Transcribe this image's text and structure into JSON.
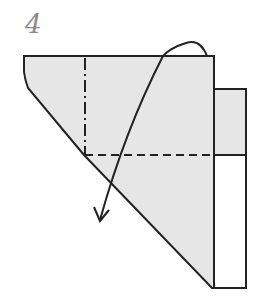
{
  "diagram": {
    "step_number": "4",
    "colors": {
      "paper_fill": "#e6e6e6",
      "outline": "#222222",
      "back_strip_fill": "#ffffff",
      "step_number": "#8a8a8a"
    },
    "elements": [
      {
        "type": "folded-paper-shape",
        "description": "grey shaded trapezoid/triangle paper"
      },
      {
        "type": "right-strip-upper",
        "description": "shaded strip right of main shape above dashed line"
      },
      {
        "type": "right-strip-lower",
        "description": "white strip below dashed line"
      },
      {
        "type": "valley-fold-line",
        "style": "dashed",
        "orientation": "horizontal"
      },
      {
        "type": "mountain-fold-line",
        "style": "dash-dot",
        "orientation": "vertical"
      },
      {
        "type": "fold-arrow",
        "direction": "curving over top, down to lower left"
      }
    ]
  }
}
